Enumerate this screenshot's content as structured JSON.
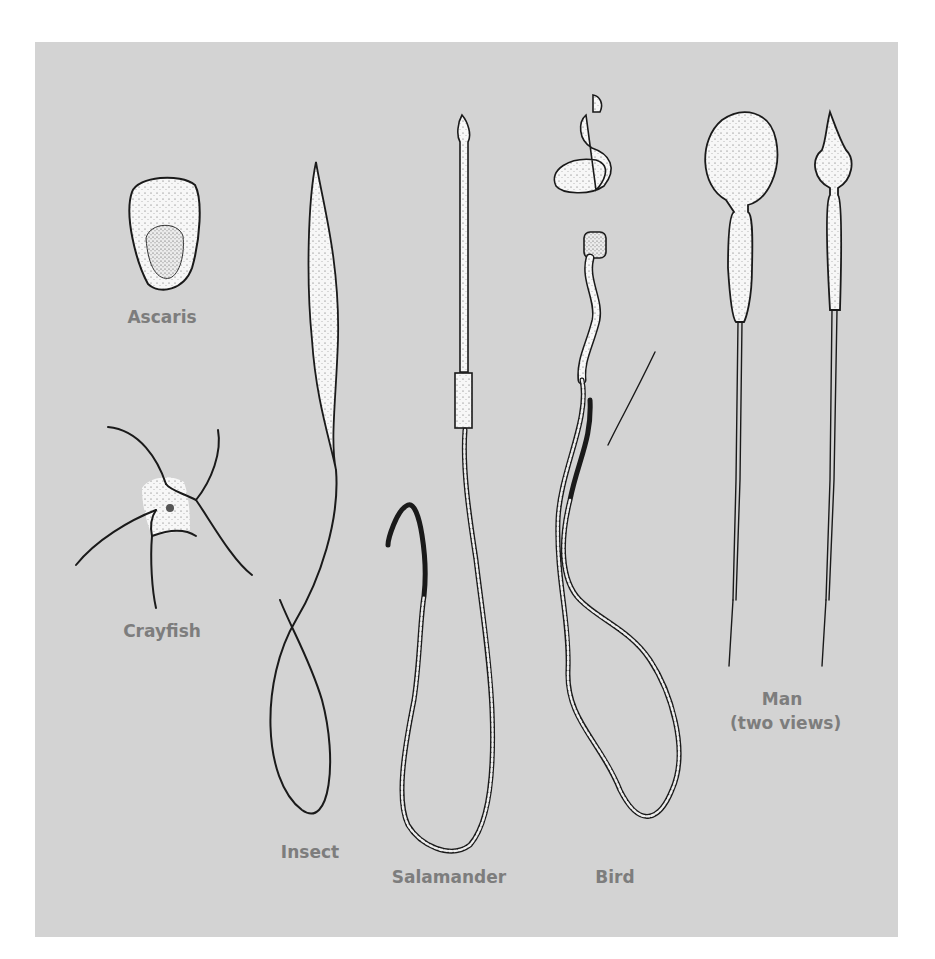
{
  "figure": {
    "background_color": "#d3d3d3",
    "label_color": "#7d7d7d",
    "ink_color": "#1a1a1a",
    "specimens": [
      {
        "id": "ascaris",
        "label": "Ascaris"
      },
      {
        "id": "crayfish",
        "label": "Crayfish"
      },
      {
        "id": "insect",
        "label": "Insect"
      },
      {
        "id": "salamander",
        "label": "Salamander"
      },
      {
        "id": "bird",
        "label": "Bird"
      },
      {
        "id": "man",
        "label": "Man",
        "sublabel": "(two views)"
      }
    ]
  }
}
